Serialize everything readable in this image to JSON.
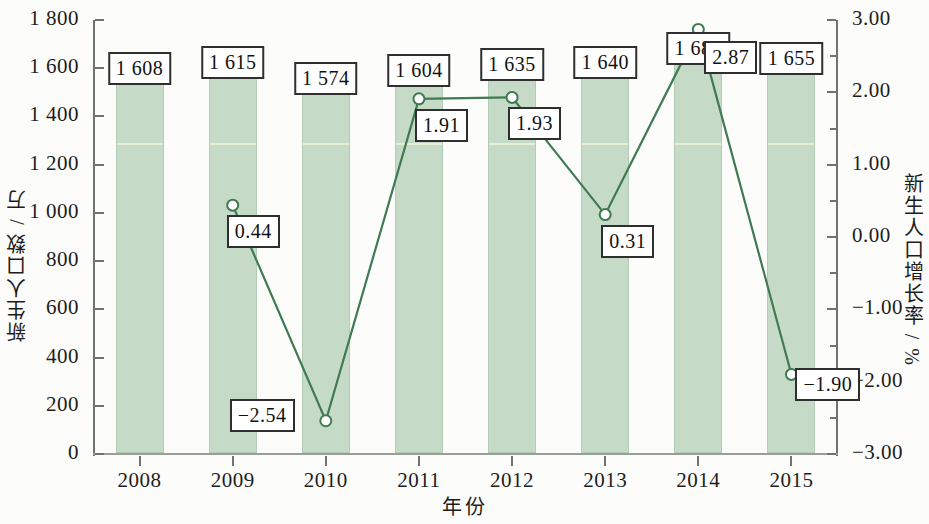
{
  "chart_data": {
    "type": "bar",
    "title": "",
    "xlabel": "年份",
    "ylabel": "新生人口数 / 万",
    "ylabel_right": "新生人口增长率 / %",
    "categories": [
      "2008",
      "2009",
      "2010",
      "2011",
      "2012",
      "2013",
      "2014",
      "2015"
    ],
    "ylim": [
      0,
      1800
    ],
    "ylim_right": [
      -3.0,
      3.0
    ],
    "yticks": [
      "0",
      "200",
      "400",
      "600",
      "800",
      "1 000",
      "1 200",
      "1 400",
      "1 600",
      "1 800"
    ],
    "yticks_right": [
      "-3.00",
      "-2.00",
      "-1.00",
      "0.00",
      "1.00",
      "2.00",
      "3.00"
    ],
    "grid": false,
    "legend_position": "none",
    "series": [
      {
        "name": "新生人口数 / 万",
        "type": "bar",
        "axis": "left",
        "values": [
          1608,
          1615,
          1574,
          1604,
          1635,
          1640,
          1687,
          1655
        ],
        "labels": [
          "1 608",
          "1 615",
          "1 574",
          "1 604",
          "1 635",
          "1 640",
          "1 687",
          "1 655"
        ]
      },
      {
        "name": "新生人口增长率 / %",
        "type": "line",
        "axis": "right",
        "values": [
          null,
          0.44,
          -2.54,
          1.91,
          1.93,
          0.31,
          2.87,
          -1.9
        ],
        "labels": [
          "",
          "0.44",
          "-2.54",
          "1.91",
          "1.93",
          "0.31",
          "2.87",
          "-1.90"
        ]
      }
    ],
    "colors": {
      "bar_fill": "#c6dbc7",
      "bar_edge": "#b3cdb5",
      "line": "#3f7a52",
      "marker_edge": "#3f7a52",
      "marker_fill": "#ffffff",
      "axis": "#6e7470",
      "text": "#1d1d1d",
      "callout_border": "#2f2f2f",
      "background": "#fcfcfa"
    }
  }
}
